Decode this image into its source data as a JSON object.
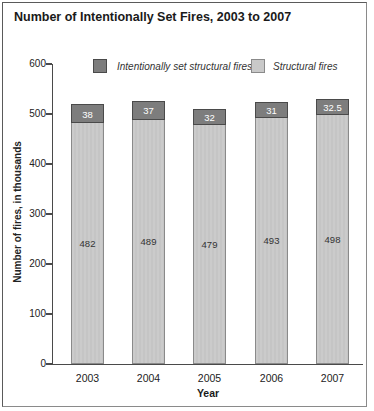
{
  "title": "Number of Intentionally Set Fires, 2003 to 2007",
  "legend": {
    "items": [
      {
        "label": "Intentionally set structural fires",
        "color": "#7d7d7d"
      },
      {
        "label": "Structural fires",
        "color": "#c9c9c9"
      }
    ]
  },
  "colors": {
    "dark_segment": "#7d7d7d",
    "dark_border": "#4a4a4a",
    "light_segment": "#c9c9c9",
    "light_border": "#8a8a8a",
    "axis": "#4a4a4a"
  },
  "chart_data": {
    "type": "bar",
    "stacked": true,
    "title": "Number of Intentionally Set Fires, 2003 to 2007",
    "categories": [
      "2003",
      "2004",
      "2005",
      "2006",
      "2007"
    ],
    "series": [
      {
        "name": "Structural fires",
        "values": [
          482,
          489,
          479,
          493,
          498
        ],
        "color": "#c9c9c9"
      },
      {
        "name": "Intentionally set structural fires",
        "values": [
          38,
          37,
          32,
          31,
          32.5
        ],
        "color": "#7d7d7d"
      }
    ],
    "totals": [
      520,
      526,
      511,
      524,
      530.5
    ],
    "xlabel": "Year",
    "ylabel": "Number of fires, in thousands",
    "ylim": [
      0,
      600
    ],
    "yticks": [
      0,
      100,
      200,
      300,
      400,
      500,
      600
    ],
    "grid": false,
    "legend_position": "top",
    "data_labels": true
  }
}
